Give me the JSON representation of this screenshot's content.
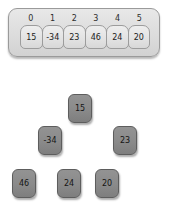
{
  "array": {
    "name": "heap-array",
    "indices": [
      "0",
      "1",
      "2",
      "3",
      "4",
      "5"
    ],
    "values": [
      "15",
      "-34",
      "23",
      "46",
      "24",
      "20"
    ]
  },
  "tree": {
    "name": "binary-heap-tree",
    "nodes": [
      {
        "label": "15",
        "level": 0,
        "index": 0,
        "x": 68,
        "y": 94
      },
      {
        "label": "-34",
        "level": 1,
        "index": 1,
        "x": 38,
        "y": 126
      },
      {
        "label": "23",
        "level": 1,
        "index": 2,
        "x": 113,
        "y": 126
      },
      {
        "label": "46",
        "level": 2,
        "index": 3,
        "x": 12,
        "y": 169
      },
      {
        "label": "24",
        "level": 2,
        "index": 4,
        "x": 57,
        "y": 169
      },
      {
        "label": "20",
        "level": 2,
        "index": 5,
        "x": 95,
        "y": 169
      }
    ]
  },
  "colors": {
    "panel_fill": "#dcdcdc",
    "panel_border": "#9a9a9a",
    "cell_fill": "#e2e2e2",
    "cell_border": "#9c9c9c",
    "node_fill": "#8a8a8a",
    "node_border": "#5d5d5d",
    "text": "#1c1c1c",
    "background": "#ffffff"
  }
}
